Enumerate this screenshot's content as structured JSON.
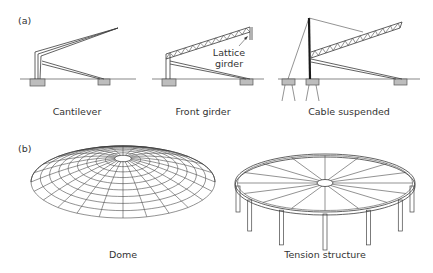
{
  "figure": {
    "panels": [
      {
        "id": "a",
        "label": "(a)",
        "items": [
          {
            "name": "cantilever",
            "caption": "Cantilever"
          },
          {
            "name": "front-girder",
            "caption": "Front girder",
            "annotation": "Lattice girder",
            "annotation_lines": [
              "Lattice",
              "girder"
            ]
          },
          {
            "name": "cable-suspended",
            "caption": "Cable suspended"
          }
        ]
      },
      {
        "id": "b",
        "label": "(b)",
        "items": [
          {
            "name": "dome",
            "caption": "Dome"
          },
          {
            "name": "tension-structure",
            "caption": "Tension structure"
          }
        ]
      }
    ]
  }
}
